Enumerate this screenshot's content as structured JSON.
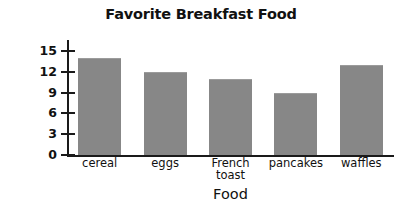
{
  "chart_data": {
    "type": "bar",
    "title": "Favorite Breakfast Food",
    "xlabel": "Food",
    "ylabel": "Number of Students",
    "categories": [
      "cereal",
      "eggs",
      "French toast",
      "pancakes",
      "waffles"
    ],
    "category_lines": [
      [
        "cereal"
      ],
      [
        "eggs"
      ],
      [
        "French",
        "toast"
      ],
      [
        "pancakes"
      ],
      [
        "waffles"
      ]
    ],
    "values": [
      14,
      12,
      11,
      9,
      13
    ],
    "ylim": [
      0,
      16
    ],
    "yticks": [
      0,
      3,
      6,
      9,
      12,
      15
    ],
    "ytick_labels": [
      "0",
      "3",
      "6",
      "9",
      "12",
      "15"
    ],
    "grid": false,
    "legend": false,
    "bar_color": "#878787",
    "axis_color": "#1a1a1a",
    "text_color": "#111111",
    "background": "#ffffff"
  }
}
